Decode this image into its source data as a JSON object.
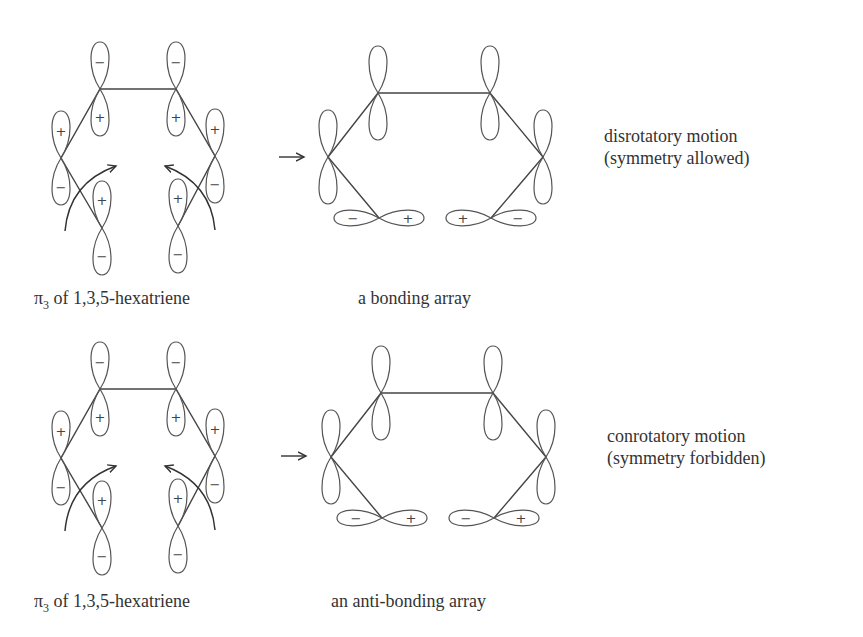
{
  "rows": [
    {
      "reactant_caption_symbol": "π",
      "reactant_caption_subscript": "3",
      "reactant_caption_rest": " of 1,3,5-hexatriene",
      "product_caption": "a bonding array",
      "motion_label": "disrotatory motion",
      "symmetry_label": "(symmetry allowed)",
      "reaction_arrow": "→",
      "reactant_signs": {
        "c1_top": "−",
        "c1_bottom": "+",
        "c6_top": "−",
        "c6_bottom": "+",
        "c2_top": "+",
        "c2_bottom": "−",
        "c5_top": "+",
        "c5_bottom": "−",
        "c3_top": "+",
        "c3_bottom": "−",
        "c4_top": "+",
        "c4_bottom": "−"
      },
      "product_signs": {
        "left_terminal_left": "−",
        "left_terminal_right": "+",
        "right_terminal_left": "+",
        "right_terminal_right": "−"
      }
    },
    {
      "reactant_caption_symbol": "π",
      "reactant_caption_subscript": "3",
      "reactant_caption_rest": " of 1,3,5-hexatriene",
      "product_caption": "an anti-bonding array",
      "motion_label": "conrotatory motion",
      "symmetry_label": "(symmetry forbidden)",
      "reaction_arrow": "→",
      "reactant_signs": {
        "c1_top": "−",
        "c1_bottom": "+",
        "c6_top": "−",
        "c6_bottom": "+",
        "c2_top": "+",
        "c2_bottom": "−",
        "c5_top": "+",
        "c5_bottom": "−",
        "c3_top": "+",
        "c3_bottom": "−",
        "c4_top": "+",
        "c4_bottom": "−"
      },
      "product_signs": {
        "left_terminal_left": "−",
        "left_terminal_right": "+",
        "right_terminal_left": "−",
        "right_terminal_right": "+"
      }
    }
  ]
}
